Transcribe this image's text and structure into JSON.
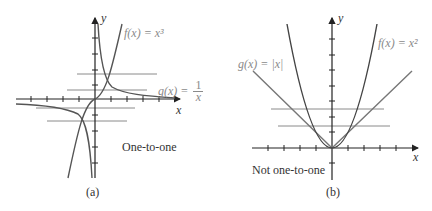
{
  "figures": [
    {
      "id": "a",
      "caption": "(a)",
      "annotation": "One-to-one",
      "axis_x_label": "x",
      "axis_y_label": "y",
      "curves": [
        {
          "name": "f",
          "label": "f(x) = x³",
          "expr": "x^3",
          "color": "#555555"
        },
        {
          "name": "g",
          "label_prefix": "g(x) = ",
          "label_num": "1",
          "label_den": "x",
          "expr": "1/x",
          "color": "#555555"
        }
      ],
      "horizontal_test_lines": 4,
      "label_color": "#8a8a8a"
    },
    {
      "id": "b",
      "caption": "(b)",
      "annotation": "Not one-to-one",
      "axis_x_label": "x",
      "axis_y_label": "y",
      "curves": [
        {
          "name": "f",
          "label": "f(x) = x²",
          "expr": "x^2",
          "color": "#555555"
        },
        {
          "name": "g",
          "label": "g(x) = |x|",
          "expr": "|x|",
          "color": "#777777"
        }
      ],
      "horizontal_test_lines": 2,
      "label_color": "#8a8a8a"
    }
  ]
}
